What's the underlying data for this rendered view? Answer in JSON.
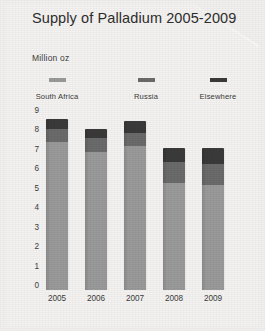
{
  "header": {
    "title": "Supply of Palladium 2005-2009",
    "subtitle": "Million oz"
  },
  "legend": [
    {
      "label": "South Africa",
      "color": "#9a9a9a"
    },
    {
      "label": "Russia",
      "color": "#6b6b6b"
    },
    {
      "label": "Elsewhere",
      "color": "#3a3a3a"
    }
  ],
  "chart_data": {
    "type": "bar",
    "stacked": true,
    "title": "Supply of Palladium 2005-2009",
    "subtitle": "Million oz",
    "xlabel": "",
    "ylabel": "Million oz",
    "ylim": [
      0,
      9
    ],
    "yticks": [
      0,
      1,
      2,
      3,
      4,
      5,
      6,
      7,
      8,
      9
    ],
    "ytick_labels": [
      "0",
      "1",
      "2",
      "3",
      "4",
      "5",
      "6",
      "7",
      "8",
      "9"
    ],
    "grid": false,
    "legend_position": "top",
    "categories": [
      "2005",
      "2006",
      "2007",
      "2008",
      "2009"
    ],
    "series": [
      {
        "name": "South Africa",
        "color": "#9a9a9a",
        "values": [
          7.6,
          7.1,
          7.4,
          5.5,
          5.4
        ]
      },
      {
        "name": "Russia",
        "color": "#6b6b6b",
        "values": [
          0.7,
          0.7,
          0.7,
          1.1,
          1.1
        ]
      },
      {
        "name": "Elsewhere",
        "color": "#3a3a3a",
        "values": [
          0.5,
          0.5,
          0.6,
          0.7,
          0.8
        ]
      }
    ],
    "totals": [
      8.8,
      8.3,
      8.7,
      7.3,
      7.3
    ]
  }
}
